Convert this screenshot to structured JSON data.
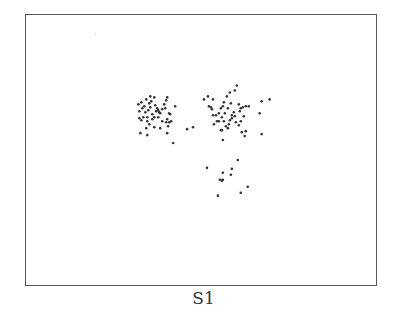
{
  "chart_data": {
    "type": "scatter",
    "title": "",
    "caption": "S1",
    "xlabel": "",
    "ylabel": "",
    "grid": false,
    "legend": null,
    "axes_ticks": false,
    "frame_px": {
      "left": 25,
      "top": 14,
      "width": 352,
      "height": 272
    },
    "marker_color": "#333333",
    "marker_radius": 1.3,
    "series": [
      {
        "name": "cluster-left",
        "points": [
          [
            138,
            104
          ],
          [
            141,
            102
          ],
          [
            144,
            106
          ],
          [
            146,
            99
          ],
          [
            149,
            103
          ],
          [
            151,
            101
          ],
          [
            150,
            107
          ],
          [
            148,
            110
          ],
          [
            145,
            112
          ],
          [
            142,
            108
          ],
          [
            139,
            111
          ],
          [
            139,
            118
          ],
          [
            143,
            117
          ],
          [
            147,
            117
          ],
          [
            147,
            121
          ],
          [
            149,
            124
          ],
          [
            152,
            114
          ],
          [
            154,
            117
          ],
          [
            156,
            111
          ],
          [
            157,
            108
          ],
          [
            155,
            105
          ],
          [
            158,
            110
          ],
          [
            159,
            112
          ],
          [
            160,
            113
          ],
          [
            162,
            109
          ],
          [
            164,
            104
          ],
          [
            166,
            100
          ],
          [
            167,
            97
          ],
          [
            165,
            108
          ],
          [
            169,
            113
          ],
          [
            167,
            119
          ],
          [
            166,
            122
          ],
          [
            169,
            122
          ],
          [
            171,
            121
          ],
          [
            168,
            126
          ],
          [
            162,
            121
          ],
          [
            160,
            128
          ],
          [
            154,
            127
          ],
          [
            146,
            128
          ],
          [
            140,
            133
          ],
          [
            147,
            135
          ],
          [
            167,
            133
          ],
          [
            170,
            114
          ],
          [
            175,
            106
          ],
          [
            154,
            97
          ],
          [
            150,
            96
          ],
          [
            173,
            143
          ],
          [
            158,
            117
          ],
          [
            152,
            119
          ],
          [
            141,
            120
          ]
        ]
      },
      {
        "name": "cluster-right",
        "points": [
          [
            204,
            99
          ],
          [
            208,
            96
          ],
          [
            213,
            99
          ],
          [
            209,
            106
          ],
          [
            211,
            107
          ],
          [
            212,
            109
          ],
          [
            213,
            115
          ],
          [
            216,
            115
          ],
          [
            219,
            113
          ],
          [
            221,
            108
          ],
          [
            223,
            106
          ],
          [
            224,
            102
          ],
          [
            227,
            96
          ],
          [
            230,
            92
          ],
          [
            235,
            90
          ],
          [
            237,
            85
          ],
          [
            231,
            103
          ],
          [
            228,
            108
          ],
          [
            225,
            113
          ],
          [
            222,
            117
          ],
          [
            219,
            121
          ],
          [
            224,
            121
          ],
          [
            226,
            126
          ],
          [
            228,
            128
          ],
          [
            229,
            124
          ],
          [
            232,
            115
          ],
          [
            235,
            116
          ],
          [
            232,
            118
          ],
          [
            236,
            122
          ],
          [
            239,
            125
          ],
          [
            241,
            121
          ],
          [
            244,
            116
          ],
          [
            239,
            104
          ],
          [
            241,
            108
          ],
          [
            240,
            111
          ],
          [
            243,
            107
          ],
          [
            246,
            106
          ],
          [
            249,
            106
          ],
          [
            242,
            132
          ],
          [
            245,
            136
          ],
          [
            246,
            131
          ],
          [
            221,
            130
          ],
          [
            223,
            140
          ],
          [
            214,
            124
          ],
          [
            217,
            121
          ],
          [
            230,
            120
          ],
          [
            234,
            112
          ],
          [
            222,
            130
          ],
          [
            260,
            113
          ],
          [
            262,
            101
          ],
          [
            270,
            99
          ],
          [
            262,
            134
          ],
          [
            187,
            129
          ],
          [
            193,
            127
          ]
        ]
      },
      {
        "name": "cluster-bottom",
        "points": [
          [
            207,
            168
          ],
          [
            223,
            173
          ],
          [
            232,
            169
          ],
          [
            231,
            175
          ],
          [
            238,
            160
          ],
          [
            220,
            180
          ],
          [
            222,
            181
          ],
          [
            223,
            180
          ],
          [
            248,
            187
          ],
          [
            241,
            193
          ],
          [
            218,
            196
          ]
        ]
      },
      {
        "name": "outlier",
        "points": [
          [
            95,
            33
          ]
        ]
      }
    ]
  }
}
